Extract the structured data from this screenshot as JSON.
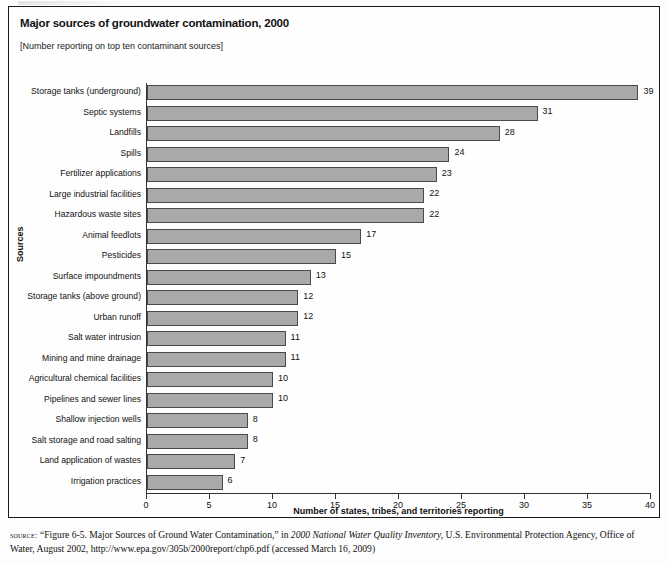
{
  "figure": {
    "title": "Major sources of groundwater contamination, 2000",
    "subtitle": "[Number reporting on top ten contaminant sources]"
  },
  "source_note": {
    "label": "source:",
    "part1": " “Figure 6-5. Major Sources of Ground Water Contamination,” in ",
    "italic1": "2000 National Water Quality Inventory,",
    "part2": " U.S. Environmental Protection Agency, Office of Water, August 2002, http://www.epa.gov/305b/2000report/chp6.pdf (accessed March 16, 2009)"
  },
  "chart_data": {
    "type": "bar",
    "orientation": "horizontal",
    "title": "Major sources of groundwater contamination, 2000",
    "subtitle": "[Number reporting on top ten contaminant sources]",
    "xlabel": "Number of states, tribes, and territories reporting",
    "ylabel": "Sources",
    "xlim": [
      0,
      40
    ],
    "xticks": [
      0,
      5,
      10,
      15,
      20,
      25,
      30,
      35,
      40
    ],
    "grid": false,
    "legend": null,
    "bar_color": "#a9a9a9",
    "bar_edge_color": "#4a4a4a",
    "categories": [
      "Storage tanks (underground)",
      "Septic systems",
      "Landfills",
      "Spills",
      "Fertilizer applications",
      "Large industrial facilities",
      "Hazardous waste sites",
      "Animal feedlots",
      "Pesticides",
      "Surface impoundments",
      "Storage tanks (above ground)",
      "Urban runoff",
      "Salt water intrusion",
      "Mining and mine drainage",
      "Agricultural chemical facilities",
      "Pipelines and sewer lines",
      "Shallow injection wells",
      "Salt storage and road salting",
      "Land application of wastes",
      "Irrigation practices"
    ],
    "values": [
      39,
      31,
      28,
      24,
      23,
      22,
      22,
      17,
      15,
      13,
      12,
      12,
      11,
      11,
      10,
      10,
      8,
      8,
      7,
      6
    ]
  }
}
